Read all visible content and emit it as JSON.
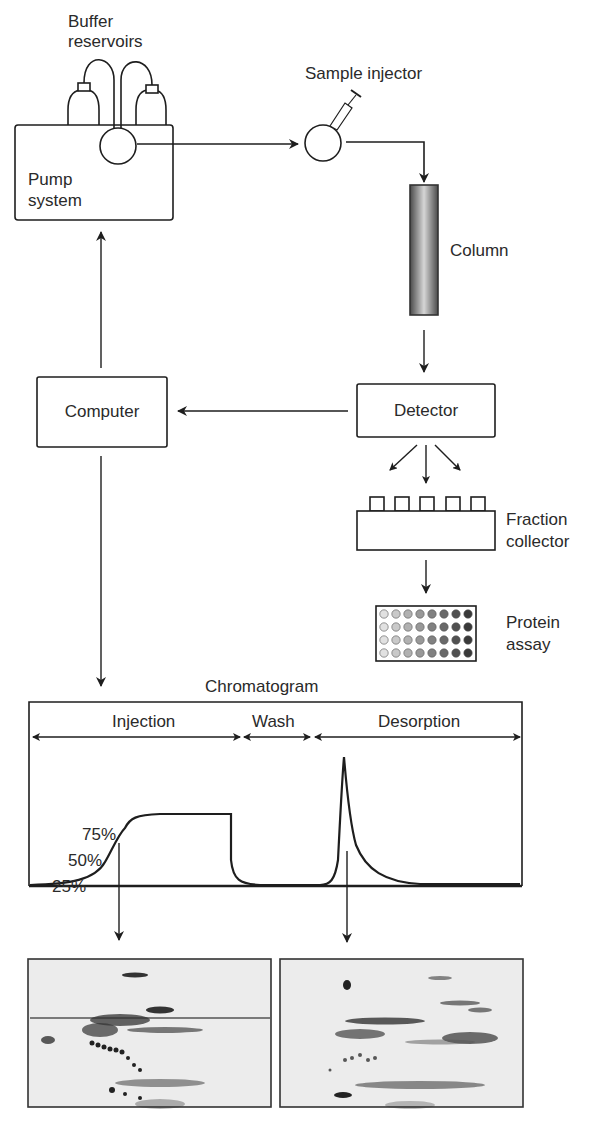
{
  "labels": {
    "buffer_reservoirs": [
      "Buffer",
      "reservoirs"
    ],
    "pump_system": [
      "Pump",
      "system"
    ],
    "sample_injector": "Sample injector",
    "column": "Column",
    "computer": "Computer",
    "detector": "Detector",
    "fraction_collector": [
      "Fraction",
      "collector"
    ],
    "protein_assay": [
      "Protein",
      "assay"
    ]
  },
  "chromatogram": {
    "title": "Chromatogram",
    "phases": [
      "Injection",
      "Wash",
      "Desorption"
    ],
    "breakthrough_marks": [
      "75%",
      "50%",
      "25%"
    ]
  },
  "gels": [
    {
      "name": "injection-breakthrough-gel"
    },
    {
      "name": "desorption-peak-gel"
    }
  ],
  "colors": {
    "line": "#1e1e1e",
    "column_dark": "#555555",
    "column_light": "#d8d8d8",
    "gel_bg": "#ececec",
    "spot": "#2b2b2b"
  },
  "chart_data": {
    "type": "line",
    "title": "Chromatogram",
    "xlabel": "",
    "ylabel": "",
    "phases": [
      {
        "name": "Injection",
        "x_range": [
          0,
          0.43
        ]
      },
      {
        "name": "Wash",
        "x_range": [
          0.43,
          0.57
        ]
      },
      {
        "name": "Desorption",
        "x_range": [
          0.57,
          1.0
        ]
      }
    ],
    "annotations": [
      "25%",
      "50%",
      "75%"
    ],
    "series": [
      {
        "name": "Detector signal",
        "x": [
          0.0,
          0.1,
          0.15,
          0.18,
          0.22,
          0.3,
          0.41,
          0.415,
          0.43,
          0.48,
          0.56,
          0.6,
          0.615,
          0.625,
          0.64,
          0.68,
          0.75,
          0.85,
          1.0
        ],
        "y": [
          0.0,
          0.05,
          0.25,
          0.5,
          0.75,
          0.97,
          1.0,
          0.5,
          0.05,
          0.0,
          0.0,
          0.1,
          0.7,
          1.8,
          0.8,
          0.2,
          0.03,
          0.0,
          0.0
        ]
      }
    ]
  }
}
